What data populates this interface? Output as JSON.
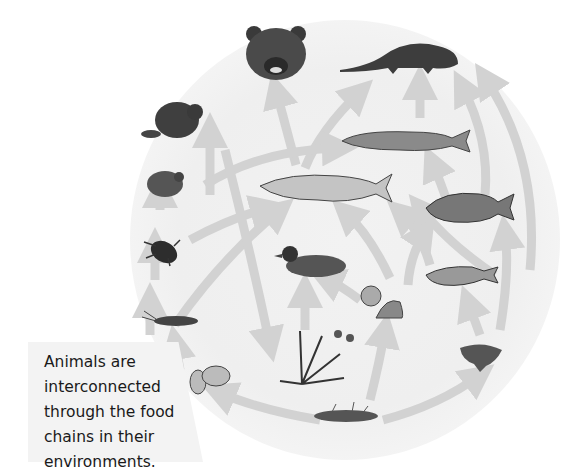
{
  "caption": {
    "lines": [
      "Animals are",
      "interconnected",
      "through the food",
      "chains in their",
      "environments."
    ]
  },
  "organisms": [
    {
      "id": "bear",
      "label": "bear"
    },
    {
      "id": "otter",
      "label": "otter"
    },
    {
      "id": "beaver",
      "label": "beaver"
    },
    {
      "id": "pike",
      "label": "pike"
    },
    {
      "id": "frog",
      "label": "frog"
    },
    {
      "id": "trout",
      "label": "trout"
    },
    {
      "id": "carp",
      "label": "carp"
    },
    {
      "id": "beetle",
      "label": "water beetle"
    },
    {
      "id": "duck",
      "label": "duck"
    },
    {
      "id": "perch",
      "label": "perch"
    },
    {
      "id": "clam",
      "label": "clam"
    },
    {
      "id": "snail",
      "label": "snail"
    },
    {
      "id": "insect-larva",
      "label": "insect larva"
    },
    {
      "id": "water-plant",
      "label": "water plant"
    },
    {
      "id": "mushroom-algae",
      "label": "algae"
    },
    {
      "id": "shrimp",
      "label": "shrimp"
    },
    {
      "id": "protozoa",
      "label": "protozoa"
    },
    {
      "id": "detritus",
      "label": "detritus"
    }
  ],
  "colors": {
    "arrow": "#d2d2d2",
    "ink": "#2b2b2b",
    "background": "#efefef"
  }
}
